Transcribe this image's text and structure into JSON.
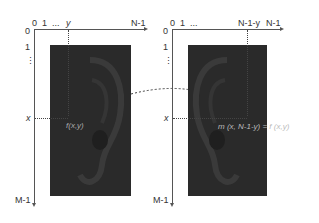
{
  "left_image": {
    "x_ticks": [
      "0",
      "1",
      "...",
      "y",
      "N-1"
    ],
    "y_ticks": [
      "0",
      "1",
      "⋮",
      "x",
      "M-1"
    ],
    "pixel_label": "f(x,y)"
  },
  "right_image": {
    "x_ticks": [
      "0",
      "1",
      "...",
      "N-1-y",
      "N-1"
    ],
    "y_ticks": [
      "0",
      "1",
      "⋮",
      "x",
      "M-1"
    ],
    "formula": "m (x, N-1-y) = f (x,y)"
  },
  "colors": {
    "image_bg": "#2a2a2a",
    "axis": "#555555",
    "text": "#333333"
  }
}
